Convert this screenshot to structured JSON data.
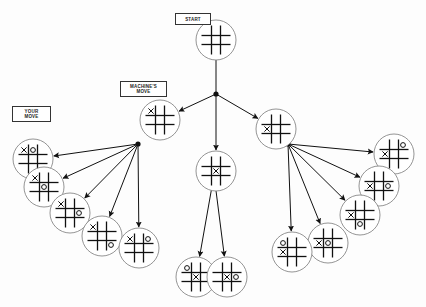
{
  "labels": {
    "start": "START",
    "machine_move": "MACHINE'S\nMOVE",
    "your_move": "YOUR\nMOVE"
  },
  "colors": {
    "ink": "#111111",
    "circle": "#888888",
    "background": "#fdfdfd"
  },
  "tree": {
    "root": {
      "id": "start",
      "cx": 216,
      "cy": 40,
      "board": [
        "",
        "",
        "",
        "",
        "",
        "",
        "",
        "",
        ""
      ]
    },
    "root_junction": {
      "x": 216,
      "y": 94
    },
    "machine_moves": [
      {
        "id": "corner",
        "cx": 160,
        "cy": 120,
        "board": [
          "X",
          "",
          "",
          "",
          "",
          "",
          "",
          "",
          ""
        ],
        "junction": {
          "x": 138,
          "y": 144
        },
        "replies": [
          {
            "cx": 33,
            "cy": 159,
            "board": [
              "X",
              "O",
              "",
              "",
              "",
              "",
              "",
              "",
              ""
            ]
          },
          {
            "cx": 44,
            "cy": 187,
            "board": [
              "X",
              "",
              "",
              "",
              "O",
              "",
              "",
              "",
              ""
            ]
          },
          {
            "cx": 70,
            "cy": 213,
            "board": [
              "X",
              "",
              "",
              "",
              "",
              "O",
              "",
              "",
              ""
            ]
          },
          {
            "cx": 102,
            "cy": 236,
            "board": [
              "X",
              "",
              "",
              "",
              "",
              "",
              "",
              "",
              "O"
            ]
          },
          {
            "cx": 139,
            "cy": 248,
            "board": [
              "X",
              "",
              "O",
              "",
              "",
              "",
              "",
              "",
              ""
            ]
          }
        ]
      },
      {
        "id": "center",
        "cx": 216,
        "cy": 171,
        "board": [
          "",
          "",
          "",
          "",
          "X",
          "",
          "",
          "",
          ""
        ],
        "junction": {
          "x": 214,
          "y": 175
        },
        "replies": [
          {
            "cx": 196,
            "cy": 277,
            "board": [
              "O",
              "",
              "",
              "",
              "X",
              "",
              "",
              "",
              ""
            ]
          },
          {
            "cx": 227,
            "cy": 277,
            "board": [
              "",
              "",
              "",
              "",
              "X",
              "O",
              "",
              "",
              ""
            ]
          }
        ]
      },
      {
        "id": "edge",
        "cx": 276,
        "cy": 129,
        "board": [
          "",
          "",
          "",
          "X",
          "",
          "",
          "",
          "",
          ""
        ],
        "junction": {
          "x": 288,
          "y": 144
        },
        "replies": [
          {
            "cx": 394,
            "cy": 154,
            "board": [
              "",
              "",
              "O",
              "X",
              "",
              "",
              "",
              "",
              ""
            ]
          },
          {
            "cx": 379,
            "cy": 186,
            "board": [
              "",
              "",
              "",
              "X",
              "",
              "O",
              "",
              "",
              ""
            ]
          },
          {
            "cx": 360,
            "cy": 215,
            "board": [
              "",
              "",
              "",
              "X",
              "",
              "",
              "",
              "O",
              ""
            ]
          },
          {
            "cx": 328,
            "cy": 243,
            "board": [
              "",
              "",
              "",
              "X",
              "O",
              "",
              "",
              "",
              ""
            ]
          },
          {
            "cx": 292,
            "cy": 252,
            "board": [
              "O",
              "",
              "",
              "X",
              "",
              "",
              "",
              "",
              ""
            ]
          }
        ]
      }
    ]
  }
}
